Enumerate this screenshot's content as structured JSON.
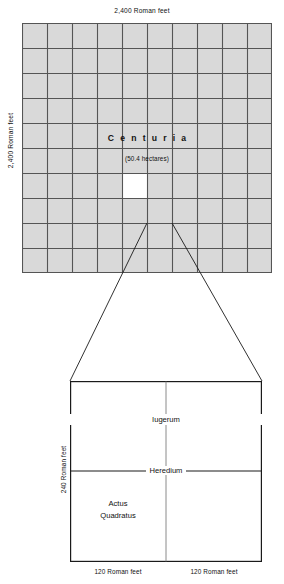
{
  "chart_data": {
    "type": "diagram",
    "upper": {
      "name": "Centuria",
      "area_note": "(50.4 hectares)",
      "width_label": "2,400 Roman feet",
      "height_label": "2,400 Roman feet",
      "grid_columns": 10,
      "grid_rows": 10,
      "highlight_cell": {
        "row": 7,
        "col": 5
      },
      "cell_fill": "#d9d9d9",
      "highlight_fill": "#ffffff",
      "line_color": "#555555"
    },
    "lower": {
      "iugerum": "Iugerum",
      "heredium": "Heredium",
      "actus_line1": "Actus",
      "actus_line2": "Quadratus",
      "height_label": "240 Roman feet",
      "width_label_left": "120 Roman feet",
      "width_label_right": "120 Roman feet",
      "line_color": "#1a1a1a"
    }
  },
  "upper": {
    "top_label": "2,400 Roman feet",
    "left_label": "2,400 Roman feet",
    "centuria": "Centuria",
    "hectares": "(50.4 hectares)"
  },
  "lower": {
    "iugerum": "Iugerum",
    "heredium": "Heredium",
    "actus_line1": "Actus",
    "actus_line2": "Quadratus",
    "left_label": "240 Roman feet",
    "bottom_label_left": "120 Roman feet",
    "bottom_label_right": "120 Roman feet"
  }
}
